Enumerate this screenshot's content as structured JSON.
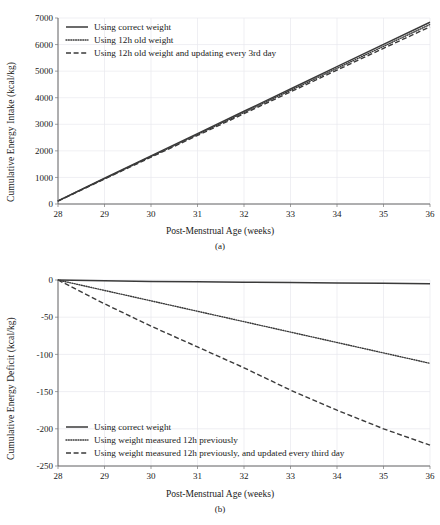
{
  "figure": {
    "panels": [
      {
        "id": "a",
        "caption": "(a)",
        "xlabel": "Post-Menstrual Age (weeks)",
        "ylabel": "Cumulative Energy Intake (kcal/kg)"
      },
      {
        "id": "b",
        "caption": "(b)",
        "xlabel": "Post-Menstrual Age (weeks)",
        "ylabel": "Cumulative Energy Deficit (kcal/kg)"
      }
    ]
  },
  "chart_data": [
    {
      "type": "line",
      "panel": "a",
      "title": "",
      "xlabel": "Post-Menstrual Age (weeks)",
      "ylabel": "Cumulative Energy Intake (kcal/kg)",
      "xlim": [
        28,
        36
      ],
      "ylim": [
        0,
        7000
      ],
      "xticks": [
        28,
        29,
        30,
        31,
        32,
        33,
        34,
        35,
        36
      ],
      "yticks": [
        0,
        1000,
        2000,
        3000,
        4000,
        5000,
        6000,
        7000
      ],
      "grid": true,
      "legend_position": "upper-left",
      "x": [
        28,
        29,
        30,
        31,
        32,
        33,
        34,
        35,
        36
      ],
      "series": [
        {
          "name": "Using correct weight",
          "style": "solid",
          "values": [
            120,
            970,
            1810,
            2650,
            3490,
            4330,
            5170,
            6010,
            6840
          ]
        },
        {
          "name": "Using 12h old weight",
          "style": "dotted",
          "values": [
            115,
            955,
            1785,
            2615,
            3445,
            4275,
            5105,
            5935,
            6755
          ]
        },
        {
          "name": "Using 12h old weight and updating every 3rd day",
          "style": "dashed",
          "values": [
            110,
            940,
            1760,
            2580,
            3400,
            4220,
            5040,
            5860,
            6670
          ]
        }
      ]
    },
    {
      "type": "line",
      "panel": "b",
      "title": "",
      "xlabel": "Post-Menstrual Age (weeks)",
      "ylabel": "Cumulative Energy Deficit (kcal/kg)",
      "xlim": [
        28,
        36
      ],
      "ylim": [
        -250,
        0
      ],
      "xticks": [
        28,
        29,
        30,
        31,
        32,
        33,
        34,
        35,
        36
      ],
      "yticks": [
        0,
        -50,
        -100,
        -150,
        -200,
        -250
      ],
      "grid": true,
      "legend_position": "lower-left",
      "x": [
        28,
        29,
        30,
        31,
        32,
        33,
        34,
        35,
        36
      ],
      "series": [
        {
          "name": "Using correct weight",
          "style": "solid",
          "values": [
            0,
            -1,
            -2,
            -2.5,
            -3,
            -3.5,
            -4,
            -4.5,
            -5
          ]
        },
        {
          "name": "Using weight measured 12h previously",
          "style": "dotted",
          "values": [
            0,
            -14,
            -28,
            -42,
            -56,
            -70,
            -84,
            -98,
            -112
          ]
        },
        {
          "name": "Using weight measured 12h previously, and updated every third day",
          "style": "dashed",
          "values": [
            0,
            -32,
            -62,
            -90,
            -118,
            -148,
            -175,
            -200,
            -222
          ]
        }
      ]
    }
  ]
}
